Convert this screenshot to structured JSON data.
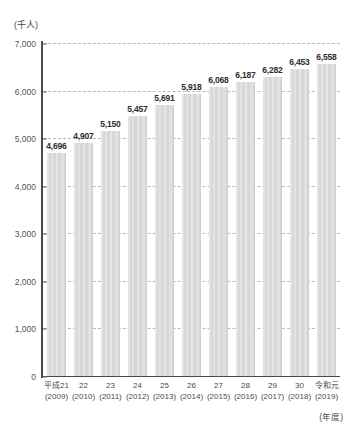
{
  "chart_data": {
    "type": "bar",
    "title": "",
    "subtitle": "",
    "unit_label": "(千人)",
    "xlabel": "(年度)",
    "ylabel": "",
    "ylim": [
      0,
      7000
    ],
    "ytick_step": 1000,
    "grid": true,
    "legend": false,
    "bar_color": "#d7d7d7",
    "categories": [
      "平成21\n(2009)",
      "22\n(2010)",
      "23\n(2011)",
      "24\n(2012)",
      "25\n(2013)",
      "26\n(2014)",
      "27\n(2015)",
      "28\n(2016)",
      "29\n(2017)",
      "30\n(2018)",
      "令和元\n(2019)"
    ],
    "era_labels": [
      "平成21",
      "22",
      "23",
      "24",
      "25",
      "26",
      "27",
      "28",
      "29",
      "30",
      "令和元"
    ],
    "gregorian_labels": [
      "(2009)",
      "(2010)",
      "(2011)",
      "(2012)",
      "(2013)",
      "(2014)",
      "(2015)",
      "(2016)",
      "(2017)",
      "(2018)",
      "(2019)"
    ],
    "values": [
      4696,
      4907,
      5150,
      5457,
      5691,
      5918,
      6068,
      6187,
      6282,
      6453,
      6558
    ],
    "value_labels": [
      "4,696",
      "4,907",
      "5,150",
      "5,457",
      "5,691",
      "5,918",
      "6,068",
      "6,187",
      "6,282",
      "6,453",
      "6,558"
    ],
    "ytick_labels": [
      "7,000",
      "6,000",
      "5,000",
      "4,000",
      "3,000",
      "2,000",
      "1,000",
      "0"
    ],
    "ytick_values": [
      7000,
      6000,
      5000,
      4000,
      3000,
      2000,
      1000,
      0
    ]
  }
}
